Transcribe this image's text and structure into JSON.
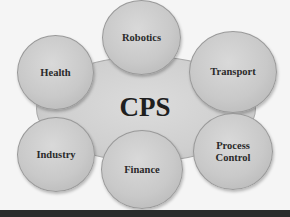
{
  "diagram": {
    "center": {
      "label": "CPS"
    },
    "nodes": [
      {
        "id": "robotics",
        "label": "Robotics"
      },
      {
        "id": "health",
        "label": "Health"
      },
      {
        "id": "transport",
        "label": "Transport"
      },
      {
        "id": "industry",
        "label": "Industry"
      },
      {
        "id": "finance",
        "label": "Finance"
      },
      {
        "id": "process-control",
        "label": "Process\nControl"
      }
    ],
    "colors": {
      "background": "#f5f5f5",
      "node_fill": "#cccccc",
      "text": "#2a2a2a",
      "bottom_bar": "#2b2b2b"
    }
  }
}
